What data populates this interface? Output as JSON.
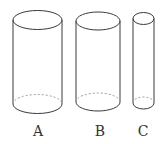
{
  "diagram": {
    "stroke_color": "#3a3a3a",
    "hidden_stroke_color": "#9a9a9a",
    "cylinders": [
      {
        "label": "A",
        "cx": 37.5,
        "rx": 24.5,
        "top_cy": 20,
        "bottom_cy": 104,
        "ry": 9.5,
        "label_x": 38,
        "label_y": 124
      },
      {
        "label": "B",
        "cx": 98,
        "rx": 22,
        "top_cy": 21,
        "bottom_cy": 102,
        "ry": 9,
        "label_x": 100,
        "label_y": 124
      },
      {
        "label": "C",
        "cx": 143.5,
        "rx": 10.5,
        "top_cy": 18.5,
        "bottom_cy": 103,
        "ry": 6,
        "label_x": 143,
        "label_y": 124
      }
    ]
  }
}
